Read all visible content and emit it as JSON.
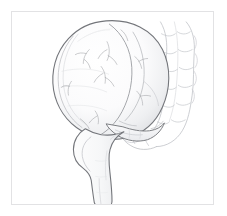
{
  "page": {
    "background_color": "#ffffff",
    "width": 227,
    "height": 216
  },
  "top_text_remnant": {
    "description": "illegible cut-off glyph descenders from a text line above the crop",
    "fragments": [
      "",
      "",
      ""
    ],
    "color": "#d8d8dc"
  },
  "figure": {
    "name": "cecum-ileum-appendix-illustration",
    "caption": "",
    "frame": {
      "border_color": "#e2e2e4",
      "background_color": "#ffffff",
      "x": 11,
      "y": 11,
      "width": 203,
      "height": 194
    },
    "style": {
      "medium": "pencil line drawing",
      "outline_color": "#6f7176",
      "light_outline_color": "#b9bbc0",
      "faint_line_color": "#cfd1d5",
      "shade_color": "#e9eaec",
      "fill_color": "#fdfdfd"
    },
    "structures": [
      {
        "id": "cecum",
        "label": "Cecum",
        "visible_label": ""
      },
      {
        "id": "ileum",
        "label": "Terminal ileum",
        "visible_label": ""
      },
      {
        "id": "appendix",
        "label": "Vermiform appendix",
        "visible_label": ""
      },
      {
        "id": "ascending-colon",
        "label": "Ascending colon with haustra",
        "visible_label": ""
      },
      {
        "id": "haustra",
        "label": "Haustral sacculations",
        "visible_label": ""
      },
      {
        "id": "vessels",
        "label": "Surface vasculature",
        "visible_label": ""
      }
    ]
  }
}
